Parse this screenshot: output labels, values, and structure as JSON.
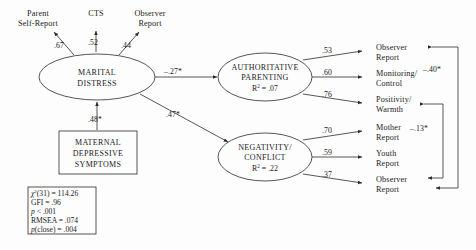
{
  "diagram": {
    "type": "path-diagram",
    "title_visible": false,
    "colors": {
      "stroke": "#2b2b2b",
      "text": "#1a1a1a",
      "background": "#fdfdfd"
    },
    "latents": [
      {
        "id": "marital-distress",
        "line1": "MARITAL",
        "line2": "DISTRESS",
        "shape": "ellipse"
      },
      {
        "id": "authoritative-parenting",
        "line1": "AUTHORITATIVE",
        "line2": "PARENTING",
        "shape": "ellipse",
        "rsq_label": "R",
        "rsq_sup": "2",
        "rsq_value": " = .07"
      },
      {
        "id": "negativity-conflict",
        "line1": "NEGATIVITY/",
        "line2": "CONFLICT",
        "shape": "ellipse",
        "rsq_label": "R",
        "rsq_sup": "2",
        "rsq_value": " = .22"
      }
    ],
    "observed_box": {
      "id": "maternal-depressive-symptoms",
      "line1": "MATERNAL",
      "line2": "DEPRESSIVE",
      "line3": "SYMPTOMS",
      "shape": "rectangle"
    },
    "indicators_top": [
      {
        "id": "parent-self-report",
        "line1": "Parent",
        "line2": "Self-Report",
        "loading": ".67"
      },
      {
        "id": "cts",
        "line1": "CTS",
        "line2": "",
        "loading": ".52"
      },
      {
        "id": "observer-report-marital",
        "line1": "Observer",
        "line2": "Report",
        "loading": ".44"
      }
    ],
    "indicators_parenting": [
      {
        "id": "observer-report-parenting",
        "line1": "Observer",
        "line2": "Report",
        "loading": ".53"
      },
      {
        "id": "monitoring-control",
        "line1": "Monitoring/",
        "line2": "Control",
        "loading": ".60"
      },
      {
        "id": "positivity-warmth",
        "line1": "Positivity/",
        "line2": "Warmth",
        "loading": ".76"
      }
    ],
    "indicators_negativity": [
      {
        "id": "mother-report",
        "line1": "Mother",
        "line2": "Report",
        "loading": ".70"
      },
      {
        "id": "youth-report",
        "line1": "Youth",
        "line2": "Report",
        "loading": ".59"
      },
      {
        "id": "observer-report-negativity",
        "line1": "Observer",
        "line2": "Report",
        "loading": ".37"
      }
    ],
    "structural_paths": [
      {
        "id": "md-to-ap",
        "from": "marital-distress",
        "to": "authoritative-parenting",
        "coefficient": "–.27*"
      },
      {
        "id": "md-to-nc",
        "from": "marital-distress",
        "to": "negativity-conflict",
        "coefficient": ".47*"
      },
      {
        "id": "mds-to-md",
        "from": "maternal-depressive-symptoms",
        "to": "marital-distress",
        "coefficient": ".48*"
      }
    ],
    "correlations": [
      {
        "id": "corr-outer",
        "coefficient": "–.40*",
        "from": "observer-report-parenting",
        "to": "observer-report-negativity"
      },
      {
        "id": "corr-inner",
        "coefficient": "–.13*",
        "from": "positivity-warmth",
        "to": "observer-report-negativity"
      }
    ],
    "fit_statistics": {
      "id": "fit-statistics-box",
      "lines": [
        {
          "pre_italic": "χ",
          "sup": "2",
          "post": "(31) = 114.26"
        },
        {
          "plain": "GFI = .96"
        },
        {
          "italic": "p",
          "post": " < .001"
        },
        {
          "plain": "RMSEA = .074"
        },
        {
          "italic": "p",
          "post": "(close) = .004"
        }
      ]
    }
  }
}
